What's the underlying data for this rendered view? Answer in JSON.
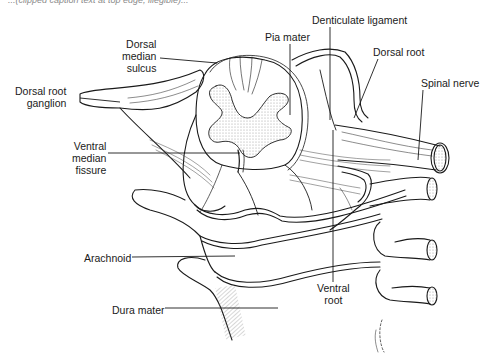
{
  "figure": {
    "caption_fragment": "...(clipped caption text at top edge, illegible)...",
    "colors": {
      "ink": "#1a1a1a",
      "stipple": "#c8c8c8",
      "background": "#ffffff",
      "caption": "#8a8a8a"
    }
  },
  "labels": [
    {
      "id": "denticulate-ligament",
      "lines": [
        "Denticulate ligament"
      ],
      "x": 312,
      "y": 14,
      "align": "left",
      "leader": [
        [
          330,
          27
        ],
        [
          330,
          120
        ]
      ]
    },
    {
      "id": "pia-mater",
      "lines": [
        "Pia mater"
      ],
      "x": 265,
      "y": 31,
      "align": "left",
      "leader": [
        [
          290,
          44
        ],
        [
          290,
          115
        ]
      ]
    },
    {
      "id": "dorsal-root",
      "lines": [
        "Dorsal root"
      ],
      "x": 373,
      "y": 46,
      "align": "left",
      "leader": [
        [
          378,
          59
        ],
        [
          354,
          118
        ]
      ]
    },
    {
      "id": "dorsal-median-sulcus",
      "lines": [
        "Dorsal",
        "median",
        "sulcus"
      ],
      "x": 122,
      "y": 38,
      "align": "right",
      "leader": [
        [
          160,
          58
        ],
        [
          217,
          63
        ]
      ]
    },
    {
      "id": "spinal-nerve",
      "lines": [
        "Spinal nerve"
      ],
      "x": 421,
      "y": 77,
      "align": "left",
      "leader": [
        [
          423,
          90
        ],
        [
          418,
          160
        ]
      ]
    },
    {
      "id": "dorsal-root-ganglion",
      "lines": [
        "Dorsal root",
        "ganglion"
      ],
      "x": 15,
      "y": 85,
      "align": "right",
      "leader": [
        [
          80,
          98
        ],
        [
          120,
          102
        ]
      ]
    },
    {
      "id": "ventral-median-fissure",
      "lines": [
        "Ventral",
        "median",
        "fissure"
      ],
      "x": 72,
      "y": 140,
      "align": "right",
      "leader": [
        [
          108,
          153
        ],
        [
          240,
          153
        ]
      ]
    },
    {
      "id": "arachnoid",
      "lines": [
        "Arachnoid"
      ],
      "x": 84,
      "y": 252,
      "align": "left",
      "leader": [
        [
          132,
          257
        ],
        [
          235,
          256
        ]
      ]
    },
    {
      "id": "dura-mater",
      "lines": [
        "Dura mater"
      ],
      "x": 112,
      "y": 304,
      "align": "left",
      "leader": [
        [
          165,
          308
        ],
        [
          278,
          308
        ]
      ]
    },
    {
      "id": "ventral-root",
      "lines": [
        "Ventral",
        "root"
      ],
      "x": 317,
      "y": 282,
      "align": "center",
      "leader": [
        [
          333,
          130
        ],
        [
          333,
          282
        ]
      ]
    }
  ]
}
